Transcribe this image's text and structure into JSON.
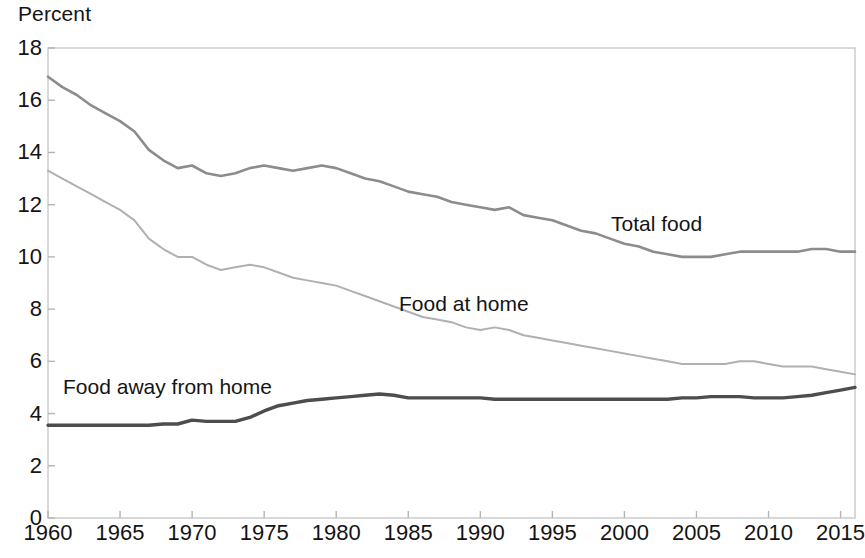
{
  "chart_data": {
    "type": "line",
    "title": "",
    "subtitle": "",
    "xlabel": "",
    "ylabel": "Percent",
    "ylim": [
      0,
      18
    ],
    "xlim": [
      1960,
      2016
    ],
    "grid": false,
    "legend_position": "inline-annotations",
    "y_ticks": [
      0,
      2,
      4,
      6,
      8,
      10,
      12,
      14,
      16,
      18
    ],
    "x_ticks": [
      1960,
      1965,
      1970,
      1975,
      1980,
      1985,
      1990,
      1995,
      2000,
      2005,
      2010,
      2015
    ],
    "x": [
      1960,
      1961,
      1962,
      1963,
      1964,
      1965,
      1966,
      1967,
      1968,
      1969,
      1970,
      1971,
      1972,
      1973,
      1974,
      1975,
      1976,
      1977,
      1978,
      1979,
      1980,
      1981,
      1982,
      1983,
      1984,
      1985,
      1986,
      1987,
      1988,
      1989,
      1990,
      1991,
      1992,
      1993,
      1994,
      1995,
      1996,
      1997,
      1998,
      1999,
      2000,
      2001,
      2002,
      2003,
      2004,
      2005,
      2006,
      2007,
      2008,
      2009,
      2010,
      2011,
      2012,
      2013,
      2014,
      2015,
      2016
    ],
    "series": [
      {
        "name": "Total food",
        "color": "#8c8c8c",
        "width": 2.6,
        "values": [
          16.9,
          16.5,
          16.2,
          15.8,
          15.5,
          15.2,
          14.8,
          14.1,
          13.7,
          13.4,
          13.5,
          13.2,
          13.1,
          13.2,
          13.4,
          13.5,
          13.4,
          13.3,
          13.4,
          13.5,
          13.4,
          13.2,
          13.0,
          12.9,
          12.7,
          12.5,
          12.4,
          12.3,
          12.1,
          12.0,
          11.9,
          11.8,
          11.9,
          11.6,
          11.5,
          11.4,
          11.2,
          11.0,
          10.9,
          10.7,
          10.5,
          10.4,
          10.2,
          10.1,
          10.0,
          10.0,
          10.0,
          10.1,
          10.2,
          10.2,
          10.2,
          10.2,
          10.2,
          10.3,
          10.3,
          10.2,
          10.2
        ]
      },
      {
        "name": "Food at home",
        "color": "#b0b0b0",
        "width": 2.0,
        "values": [
          13.3,
          13.0,
          12.7,
          12.4,
          12.1,
          11.8,
          11.4,
          10.7,
          10.3,
          10.0,
          10.0,
          9.7,
          9.5,
          9.6,
          9.7,
          9.6,
          9.4,
          9.2,
          9.1,
          9.0,
          8.9,
          8.7,
          8.5,
          8.3,
          8.1,
          7.9,
          7.7,
          7.6,
          7.5,
          7.3,
          7.2,
          7.3,
          7.2,
          7.0,
          6.9,
          6.8,
          6.7,
          6.6,
          6.5,
          6.4,
          6.3,
          6.2,
          6.1,
          6.0,
          5.9,
          5.9,
          5.9,
          5.9,
          6.0,
          6.0,
          5.9,
          5.8,
          5.8,
          5.8,
          5.7,
          5.6,
          5.5
        ]
      },
      {
        "name": "Food away from home",
        "color": "#4d4d4d",
        "width": 3.4,
        "values": [
          3.55,
          3.55,
          3.55,
          3.55,
          3.55,
          3.55,
          3.55,
          3.55,
          3.6,
          3.6,
          3.75,
          3.7,
          3.7,
          3.7,
          3.85,
          4.1,
          4.3,
          4.4,
          4.5,
          4.55,
          4.6,
          4.65,
          4.7,
          4.75,
          4.7,
          4.6,
          4.6,
          4.6,
          4.6,
          4.6,
          4.6,
          4.55,
          4.55,
          4.55,
          4.55,
          4.55,
          4.55,
          4.55,
          4.55,
          4.55,
          4.55,
          4.55,
          4.55,
          4.55,
          4.6,
          4.6,
          4.65,
          4.65,
          4.65,
          4.6,
          4.6,
          4.6,
          4.65,
          4.7,
          4.8,
          4.9,
          5.0
        ]
      }
    ],
    "annotations": [
      {
        "text": "Total food",
        "x": 2005,
        "y": 11.2
      },
      {
        "text": "Food at home",
        "x": 1988,
        "y": 8.2
      },
      {
        "text": "Food away from home",
        "x": 1962,
        "y": 5.1
      }
    ]
  },
  "axes": {
    "y_title": "Percent",
    "y_tick_labels": [
      "18",
      "16",
      "14",
      "12",
      "10",
      "8",
      "6",
      "4",
      "2",
      "0"
    ],
    "x_tick_labels": [
      "1960",
      "1965",
      "1970",
      "1975",
      "1980",
      "1985",
      "1990",
      "1995",
      "2000",
      "2005",
      "2010",
      "2015"
    ]
  },
  "series_labels": {
    "total_food": "Total food",
    "food_at_home": "Food at home",
    "food_away_from_home": "Food away from home"
  },
  "style": {
    "frame_color": "#c9c9c9",
    "tick_color": "#b4b4b4",
    "text_color": "#141414",
    "background": "#ffffff"
  }
}
